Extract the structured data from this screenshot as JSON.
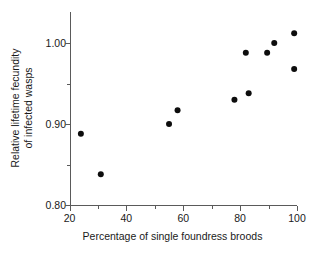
{
  "chart_data": {
    "type": "scatter",
    "title": "",
    "xlabel": "Percentage of single foundress broods",
    "ylabel_line1": "Relative lifetime fecundity",
    "ylabel_line2": "of infected wasps",
    "ylabel": "Relative lifetime fecundity of infected wasps",
    "xlim": [
      20,
      100
    ],
    "ylim": [
      0.8,
      1.025
    ],
    "xticks": [
      20,
      40,
      60,
      80,
      100
    ],
    "xtick_labels": [
      "20",
      "40",
      "60",
      "80",
      "100"
    ],
    "xminor_ticks": [
      30,
      50,
      70,
      90
    ],
    "yticks": [
      0.8,
      0.9,
      1.0
    ],
    "ytick_labels": [
      "0.80",
      "0.90",
      "1.00"
    ],
    "yminor_ticks": [
      0.85,
      0.95
    ],
    "grid": false,
    "legend": null,
    "marker": "filled-circle",
    "marker_color": "#0d0d0d",
    "marker_size_px": 6,
    "axis_color": "#5a5a5a",
    "x": [
      24,
      31,
      55,
      58,
      78,
      82,
      83,
      89.5,
      92,
      99,
      99
    ],
    "y": [
      0.888,
      0.838,
      0.9,
      0.917,
      0.93,
      0.988,
      0.938,
      0.988,
      1.0,
      0.968,
      1.012
    ],
    "points": [
      {
        "x": 24,
        "y": 0.888
      },
      {
        "x": 31,
        "y": 0.838
      },
      {
        "x": 55,
        "y": 0.9
      },
      {
        "x": 58,
        "y": 0.917
      },
      {
        "x": 78,
        "y": 0.93
      },
      {
        "x": 82,
        "y": 0.988
      },
      {
        "x": 83,
        "y": 0.938
      },
      {
        "x": 89.5,
        "y": 0.988
      },
      {
        "x": 92,
        "y": 1.0
      },
      {
        "x": 99,
        "y": 0.968
      },
      {
        "x": 99,
        "y": 1.012
      }
    ]
  }
}
